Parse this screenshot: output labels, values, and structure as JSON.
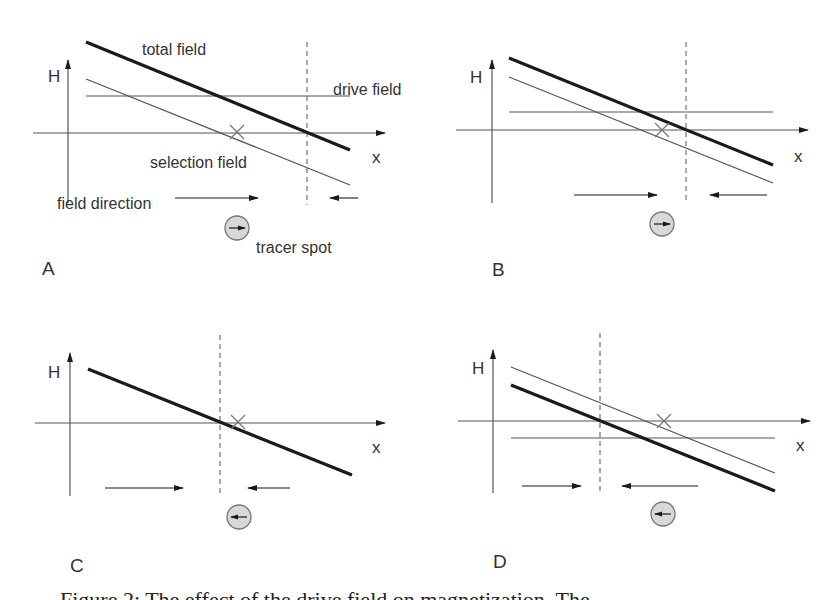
{
  "figure": {
    "colors": {
      "ink": "#1a1a1a",
      "thin_line": "#555555",
      "dashed": "#555555",
      "marker": "#777777",
      "spot_fill": "#d8d8d8",
      "spot_stroke": "#777777"
    },
    "panels": [
      {
        "id": "A",
        "label": "A",
        "label_pos": [
          42,
          275
        ],
        "h_axis": {
          "x": 68,
          "y_top": 60,
          "y_bottom": 203,
          "label": "H",
          "label_pos": [
            48,
            82
          ]
        },
        "x_axis": {
          "y": 133,
          "x_left": 33,
          "x_right": 385,
          "label": "x",
          "label_pos": [
            372,
            163
          ]
        },
        "total_field": {
          "x1": 86,
          "y1": 42,
          "x2": 350,
          "y2": 150
        },
        "selection_field": {
          "x1": 86,
          "y1": 79,
          "x2": 350,
          "y2": 185
        },
        "drive_field": {
          "y": 96,
          "x1": 86,
          "x2": 350
        },
        "ffp_dashed": {
          "x": 307,
          "y1": 42,
          "y2": 205
        },
        "cross": {
          "x": 237,
          "y": 132
        },
        "arrow_right": {
          "y": 198,
          "x1": 175,
          "x2": 258
        },
        "arrow_left": {
          "y": 198,
          "x1": 358,
          "x2": 330
        },
        "spot": {
          "x": 237,
          "y": 228,
          "r": 12,
          "direction": "right"
        },
        "annotations": [
          {
            "text": "total field",
            "x": 142,
            "y": 55
          },
          {
            "text": "drive field",
            "x": 333,
            "y": 95
          },
          {
            "text": "selection field",
            "x": 150,
            "y": 168
          },
          {
            "text": "field direction",
            "x": 57,
            "y": 209
          },
          {
            "text": "tracer spot",
            "x": 256,
            "y": 253
          }
        ]
      },
      {
        "id": "B",
        "label": "B",
        "label_pos": [
          492,
          276
        ],
        "h_axis": {
          "x": 492,
          "y_top": 60,
          "y_bottom": 203,
          "label": "H",
          "label_pos": [
            470,
            83
          ]
        },
        "x_axis": {
          "y": 130,
          "x_left": 456,
          "x_right": 808,
          "label": "x",
          "label_pos": [
            794,
            162
          ]
        },
        "total_field": {
          "x1": 509,
          "y1": 58,
          "x2": 773,
          "y2": 165
        },
        "selection_field": {
          "x1": 509,
          "y1": 77,
          "x2": 773,
          "y2": 183
        },
        "drive_field": {
          "y": 112,
          "x1": 509,
          "x2": 773
        },
        "ffp_dashed": {
          "x": 686,
          "y1": 42,
          "y2": 203
        },
        "cross": {
          "x": 662,
          "y": 130
        },
        "arrow_right": {
          "y": 195,
          "x1": 574,
          "x2": 657
        },
        "arrow_left": {
          "y": 195,
          "x1": 767,
          "x2": 710
        },
        "spot": {
          "x": 662,
          "y": 224,
          "r": 12,
          "direction": "right"
        },
        "annotations": []
      },
      {
        "id": "C",
        "label": "C",
        "label_pos": [
          70,
          572
        ],
        "h_axis": {
          "x": 70,
          "y_top": 353,
          "y_bottom": 496,
          "label": "H",
          "label_pos": [
            48,
            378
          ]
        },
        "x_axis": {
          "y": 423,
          "x_left": 35,
          "x_right": 385,
          "label": "x",
          "label_pos": [
            372,
            453
          ]
        },
        "total_field": {
          "x1": 88,
          "y1": 369,
          "x2": 352,
          "y2": 475
        },
        "selection_field": null,
        "drive_field": null,
        "ffp_dashed": {
          "x": 220,
          "y1": 335,
          "y2": 496
        },
        "cross": {
          "x": 238,
          "y": 422
        },
        "arrow_right": {
          "y": 488,
          "x1": 105,
          "x2": 183
        },
        "arrow_left": {
          "y": 488,
          "x1": 290,
          "x2": 248
        },
        "spot": {
          "x": 239,
          "y": 517,
          "r": 12,
          "direction": "left"
        },
        "annotations": []
      },
      {
        "id": "D",
        "label": "D",
        "label_pos": [
          493,
          568
        ],
        "h_axis": {
          "x": 493,
          "y_top": 350,
          "y_bottom": 493,
          "label": "H",
          "label_pos": [
            472,
            374
          ]
        },
        "x_axis": {
          "y": 421,
          "x_left": 458,
          "x_right": 810,
          "label": "x",
          "label_pos": [
            796,
            451
          ]
        },
        "total_field": {
          "x1": 511,
          "y1": 385,
          "x2": 775,
          "y2": 491
        },
        "selection_field": {
          "x1": 511,
          "y1": 367,
          "x2": 775,
          "y2": 473
        },
        "drive_field": {
          "y": 438,
          "x1": 511,
          "x2": 775
        },
        "ffp_dashed": {
          "x": 600,
          "y1": 333,
          "y2": 493
        },
        "cross": {
          "x": 664,
          "y": 421
        },
        "arrow_right": {
          "y": 486,
          "x1": 522,
          "x2": 581
        },
        "arrow_left": {
          "y": 486,
          "x1": 698,
          "x2": 622
        },
        "spot": {
          "x": 663,
          "y": 514,
          "r": 12,
          "direction": "left"
        },
        "annotations": []
      }
    ]
  },
  "caption": {
    "text": "Figure 2: The effect of the drive field on magnetization. The",
    "clipped": true
  }
}
